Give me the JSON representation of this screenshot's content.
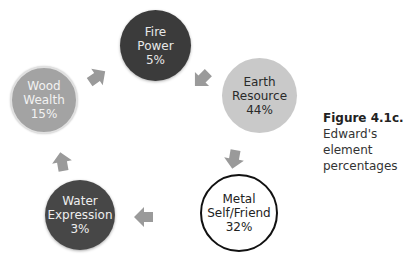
{
  "nodes": {
    "fire": {
      "name": "Fire",
      "role": "Power",
      "percent": "5%",
      "fill": "#3b3b3b"
    },
    "earth": {
      "name": "Earth",
      "role": "Resource",
      "percent": "44%",
      "fill": "#c9c9c9"
    },
    "metal": {
      "name": "Metal",
      "role": "Self/Friend",
      "percent": "32%",
      "fill": "#ffffff"
    },
    "water": {
      "name": "Water",
      "role": "Expression",
      "percent": "3%",
      "fill": "#474747"
    },
    "wood": {
      "name": "Wood",
      "role": "Wealth",
      "percent": "15%",
      "fill": "#a3a3a3"
    }
  },
  "cycle_order": [
    "Fire",
    "Earth",
    "Metal",
    "Water",
    "Wood"
  ],
  "caption": {
    "label": "Figure 4.1c.",
    "text": " Edward's element percentages"
  },
  "arrow_color": "#9a9a9a"
}
